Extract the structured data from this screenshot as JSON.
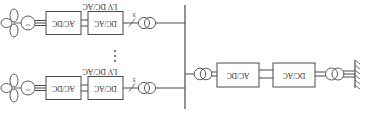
{
  "figure": {
    "title": "",
    "orientation_note": "rendered-180-degrees",
    "diagram_type": "single-line-electrical-schematic"
  },
  "hvdc_link": {
    "grid_label": "",
    "converter_1": "DC/AC",
    "converter_2": "AC/DC"
  },
  "collector_bus": {
    "label": ""
  },
  "branches": [
    {
      "id": "branch-top",
      "phase_marker": "3",
      "label": "LV DC/AC",
      "converter_1": "DC/AC",
      "converter_2": "AC/DC",
      "generator_symbol": "~"
    },
    {
      "id": "branch-bottom",
      "phase_marker": "3",
      "label": "LV DC/AC",
      "converter_1": "DC/AC",
      "converter_2": "AC/DC",
      "generator_symbol": "~"
    }
  ],
  "ellipsis": {
    "glyph": "⋮",
    "meaning": "repeated-branches"
  },
  "colors": {
    "line": "#4a4a4a",
    "text": "#2b2b2b",
    "background": "#ffffff"
  }
}
